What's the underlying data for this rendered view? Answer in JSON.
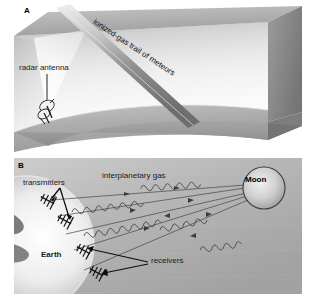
{
  "figure": {
    "kind": "two-panel scientific illustration",
    "panels": [
      {
        "letter": "A",
        "labels": {
          "radar_antenna": "radar antenna",
          "meteor_trail": "ionized-gas trail of meteors"
        },
        "elements": [
          "transparent-3d-box",
          "curved-earth-surface",
          "radar-beam-cone",
          "meteor-trail-streak",
          "radar-antenna-icon"
        ]
      },
      {
        "letter": "B",
        "labels": {
          "transmitters": "transmitters",
          "interplanetary_gas": "interplanetary gas",
          "moon": "Moon",
          "earth": "Earth",
          "receivers": "receivers"
        },
        "elements": [
          "earth-limb",
          "moon-sphere",
          "antenna-icons",
          "radio-ray-paths",
          "wave-packets"
        ]
      }
    ]
  },
  "colors": {
    "panel_a_sky_light": "#e8e8e8",
    "panel_a_box_top": "#b8b8b8",
    "panel_a_box_right": "#8f8f8f",
    "panel_a_ground": "#a9a9a9",
    "panel_b_space": "#b0b0b0",
    "earth_bright": "#f2f2f2",
    "earth_land": "#5a5a5a",
    "moon_fill": "#c9c9c9",
    "label_text": "#1a1a1a",
    "ray_line": "#4a4a4a",
    "background": "#ffffff"
  }
}
